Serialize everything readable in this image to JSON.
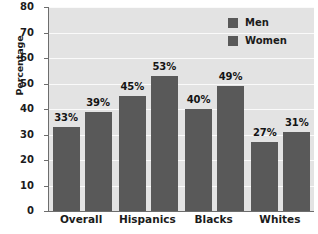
{
  "chart_data": {
    "type": "bar",
    "title": "",
    "subtitle": "",
    "xlabel": "",
    "ylabel": "Percentage",
    "categories": [
      "Overall",
      "Hispanics",
      "Blacks",
      "Whites"
    ],
    "series": [
      {
        "name": "Men",
        "values": [
          33,
          45,
          40,
          27
        ],
        "color": "#595959"
      },
      {
        "name": "Women",
        "values": [
          39,
          53,
          49,
          31
        ],
        "color": "#595959"
      }
    ],
    "value_labels": {
      "Men": [
        "33%",
        "45%",
        "40%",
        "27%"
      ],
      "Women": [
        "39%",
        "53%",
        "49%",
        "31%"
      ]
    },
    "ylim": [
      0,
      80
    ],
    "ytick_values": [
      0,
      10,
      20,
      30,
      40,
      50,
      60,
      70,
      80
    ],
    "ytick_labels": [
      "0",
      "10",
      "20",
      "30",
      "40",
      "50",
      "60",
      "70",
      "80"
    ],
    "grid": true,
    "grid_axis": "y",
    "legend_position": "top-right",
    "legend_entries": [
      "Men",
      "Women"
    ],
    "plot_background": "#e3e3e3",
    "gridline_color": "#fafafa",
    "axis_color": "#6d6d6d",
    "bar_color": "#595959",
    "text_color": "#1b1b1b"
  }
}
